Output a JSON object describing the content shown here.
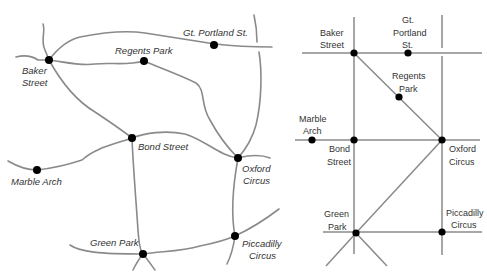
{
  "geographic_map": {
    "stations": [
      {
        "name": "Baker Street",
        "line1": "Baker",
        "line2": "Street"
      },
      {
        "name": "Regents Park",
        "label": "Regents Park"
      },
      {
        "name": "Gt. Portland St.",
        "label": "Gt. Portland St."
      },
      {
        "name": "Bond Street",
        "label": "Bond Street"
      },
      {
        "name": "Marble Arch",
        "label": "Marble Arch"
      },
      {
        "name": "Oxford Circus",
        "line1": "Oxford",
        "line2": "Circus"
      },
      {
        "name": "Green Park",
        "label": "Green Park"
      },
      {
        "name": "Piccadilly Circus",
        "line1": "Piccadilly",
        "line2": "Circus"
      }
    ]
  },
  "schematic_map": {
    "stations": [
      {
        "name": "Baker Street",
        "line1": "Baker",
        "line2": "Street"
      },
      {
        "name": "Gt. Portland St.",
        "line1": "Gt.",
        "line2": "Portland",
        "line3": "St."
      },
      {
        "name": "Regents Park",
        "line1": "Regents",
        "line2": "Park"
      },
      {
        "name": "Marble Arch",
        "line1": "Marble",
        "line2": "Arch"
      },
      {
        "name": "Bond Street",
        "line1": "Bond",
        "line2": "Street"
      },
      {
        "name": "Oxford Circus",
        "line1": "Oxford",
        "line2": "Circus"
      },
      {
        "name": "Green Park",
        "line1": "Green",
        "line2": "Park"
      },
      {
        "name": "Piccadilly Circus",
        "line1": "Piccadilly",
        "line2": "Circus"
      }
    ]
  }
}
